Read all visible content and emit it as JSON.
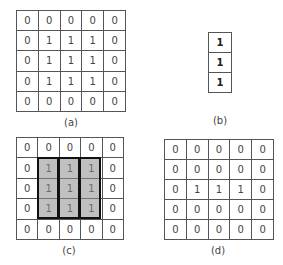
{
  "figure": {
    "panels": [
      {
        "id": "a",
        "label": "(a)",
        "matrix": [
          [
            "0",
            "0",
            "0",
            "0",
            "0"
          ],
          [
            "0",
            "1",
            "1",
            "1",
            "0"
          ],
          [
            "0",
            "1",
            "1",
            "1",
            "0"
          ],
          [
            "0",
            "1",
            "1",
            "1",
            "0"
          ],
          [
            "0",
            "0",
            "0",
            "0",
            "0"
          ]
        ]
      },
      {
        "id": "b",
        "label": "(b)",
        "matrix": [
          [
            "1"
          ],
          [
            "1"
          ],
          [
            "1"
          ]
        ]
      },
      {
        "id": "c",
        "label": "(c)",
        "matrix": [
          [
            "0",
            "0",
            "0",
            "0",
            "0"
          ],
          [
            "0",
            "1",
            "1",
            "1",
            "0"
          ],
          [
            "0",
            "1",
            "1",
            "1",
            "0"
          ],
          [
            "0",
            "1",
            "1",
            "1",
            "0"
          ],
          [
            "0",
            "0",
            "0",
            "0",
            "0"
          ]
        ],
        "highlight": {
          "description": "three vertical 3x1 windows over columns 2-4, rows 2-4",
          "fill": "#a8a8a8",
          "border": "#111111"
        }
      },
      {
        "id": "d",
        "label": "(d)",
        "matrix": [
          [
            "0",
            "0",
            "0",
            "0",
            "0"
          ],
          [
            "0",
            "0",
            "0",
            "0",
            "0"
          ],
          [
            "0",
            "1",
            "1",
            "1",
            "0"
          ],
          [
            "0",
            "0",
            "0",
            "0",
            "0"
          ],
          [
            "0",
            "0",
            "0",
            "0",
            "0"
          ]
        ]
      }
    ]
  }
}
